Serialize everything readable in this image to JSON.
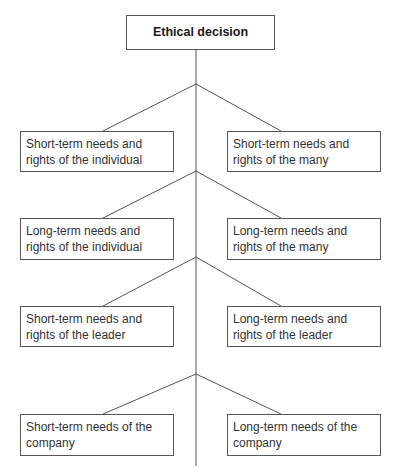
{
  "diagram": {
    "title": "Ethical decision",
    "line_color": "#555555",
    "rows": [
      {
        "left": "Short-term needs and rights of the individual",
        "right": "Short-term needs and rights of the many"
      },
      {
        "left": "Long-term needs and rights of the individual",
        "right": "Long-term needs and rights of the many"
      },
      {
        "left": "Short-term needs and rights of the leader",
        "right": "Long-term needs and rights of the leader"
      },
      {
        "left": "Short-term needs of the company",
        "right": "Long-term needs of the company"
      }
    ]
  }
}
